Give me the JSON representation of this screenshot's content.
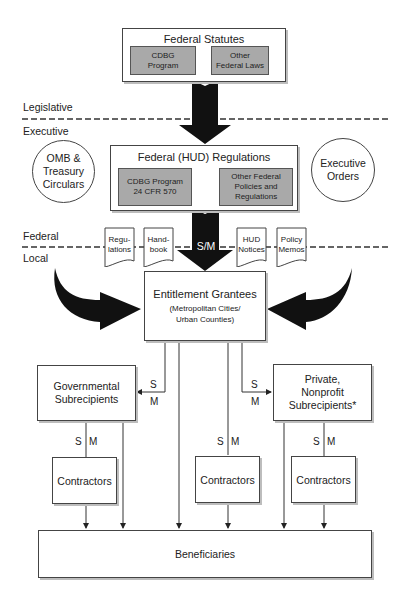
{
  "federal_statutes": {
    "title": "Federal Statutes",
    "items": [
      {
        "line1": "CDBG",
        "line2": "Program"
      },
      {
        "line1": "Other",
        "line2": "Federal Laws"
      }
    ]
  },
  "divisions": {
    "legislative": "Legislative",
    "executive": "Executive",
    "federal": "Federal",
    "local": "Local"
  },
  "hud_regulations": {
    "title": "Federal (HUD) Regulations",
    "items": [
      {
        "line1": "CDBG Program",
        "line2": "24 CFR 570",
        "line3": ""
      },
      {
        "line1": "Other Federal",
        "line2": "Policies and",
        "line3": "Regulations"
      }
    ]
  },
  "side_sources": {
    "left": {
      "line1": "OMB &",
      "line2": "Treasury",
      "line3": "Circulars"
    },
    "right": {
      "line1": "Executive",
      "line2": "Orders"
    }
  },
  "documents": [
    {
      "line1": "Regu-",
      "line2": "lations"
    },
    {
      "line1": "Hand-",
      "line2": "book"
    },
    {
      "line1": "HUD",
      "line2": "Notices"
    },
    {
      "line1": "Policy",
      "line2": "Memos"
    }
  ],
  "central_arrow_label": "S/M",
  "entitlement": {
    "title": "Entitlement Grantees",
    "line2": "(Metropolitan Cities/",
    "line3": "Urban Counties)"
  },
  "subrecipients": {
    "governmental": {
      "line1": "Governmental",
      "line2": "Subrecipients"
    },
    "private": {
      "line1": "Private,",
      "line2": "Nonprofit",
      "line3": "Subrecipients*"
    }
  },
  "relationship_labels": {
    "s": "S",
    "m": "M"
  },
  "contractors": [
    {
      "label": "Contractors"
    },
    {
      "label": "Contractors"
    },
    {
      "label": "Contractors"
    }
  ],
  "beneficiaries": {
    "label": "Beneficiaries"
  },
  "colors": {
    "arrow": "#111111",
    "inner_box": "#a9a9a9",
    "border": "#444444",
    "shadow": "#bdbdbd"
  }
}
